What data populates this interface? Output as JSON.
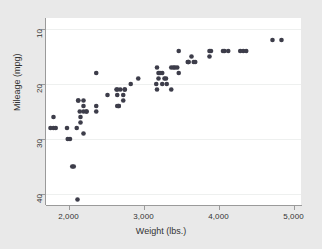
{
  "chart_data": {
    "type": "scatter",
    "title": "",
    "xlabel": "Weight (lbs.)",
    "ylabel": "Mileage (mpg)",
    "xlim": [
      1700,
      5100
    ],
    "ylim": [
      8,
      42
    ],
    "y_inverted": true,
    "grid": "horizontal",
    "legend": "none",
    "marker_color": "#3d3d4a",
    "background_color": "#e9e9e9",
    "plot_background_color": "#ffffff",
    "gridline_color": "#eef0ef",
    "axis_color": "#9a9a9a",
    "xticks": [
      2000,
      3000,
      4000,
      5000
    ],
    "xtick_labels": [
      "2,000",
      "3,000",
      "4,000",
      "5,000"
    ],
    "yticks": [
      10,
      20,
      30,
      40
    ],
    "ytick_labels": [
      "10",
      "20",
      "30",
      "40"
    ],
    "series": [
      {
        "name": "Mileage vs Weight",
        "x": [
          4720,
          3470,
          2640,
          3250,
          4080,
          3670,
          3200,
          4330,
          3900,
          4290,
          2110,
          2200,
          2690,
          3180,
          3220,
          4130,
          4370,
          2730,
          3880,
          3590,
          2050,
          3280,
          3880,
          3400,
          2370,
          2020,
          3300,
          3310,
          3370,
          2830,
          2930,
          3200,
          3420,
          3690,
          3180,
          3370,
          2200,
          2150,
          1800,
          1990,
          3250,
          2670,
          2370,
          2130,
          2650,
          3600,
          2750,
          3470,
          4060,
          3640,
          3450,
          3600,
          4840,
          2730,
          2240,
          2520,
          2160,
          2670,
          2370,
          2160,
          1980,
          1800,
          2200,
          2070,
          2130,
          2650,
          1760,
          2750,
          2120,
          2650,
          2240,
          1830,
          3170,
          2200
        ],
        "y": [
          12,
          14,
          21,
          18,
          14,
          16,
          18,
          14,
          14,
          14,
          28,
          23,
          21,
          17,
          18,
          14,
          14,
          22,
          14,
          16,
          35,
          19,
          15,
          17,
          18,
          30,
          19,
          20,
          17,
          20,
          19,
          19,
          17,
          16,
          21,
          21,
          29,
          25,
          26,
          30,
          20,
          24,
          24,
          23,
          21,
          16,
          21,
          18,
          14,
          15,
          17,
          16,
          12,
          23,
          25,
          22,
          27,
          24,
          25,
          26,
          28,
          28,
          25,
          35,
          23,
          22,
          28,
          21,
          41,
          24,
          25,
          28,
          20,
          24
        ]
      }
    ]
  }
}
